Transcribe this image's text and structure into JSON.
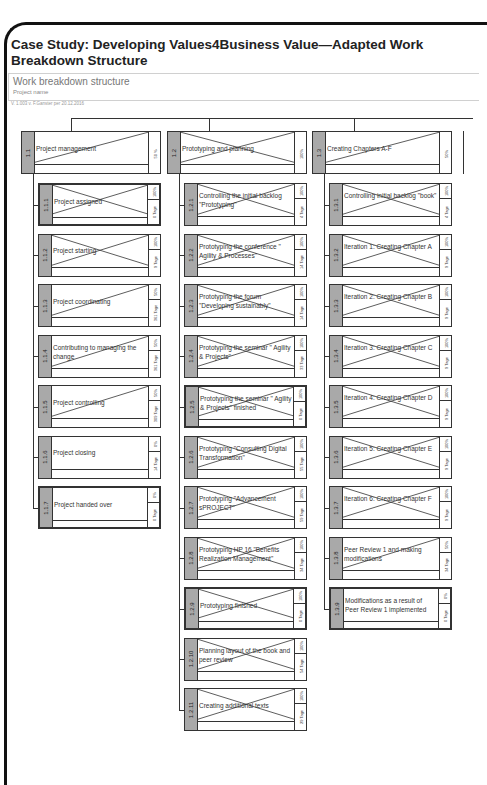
{
  "header": {
    "title": "Case Study: Developing Values4Business Value—Adapted Work Breakdown Structure",
    "wbs_title": "Work breakdown structure",
    "project_name": "Project name",
    "version": "V. 1.003 v. F.Ganster per 20.12.2016"
  },
  "columns": [
    {
      "id": "1.1",
      "label": "Project management",
      "percent": "50 %",
      "cross": "half",
      "children": [
        {
          "id": "1.1.1",
          "label": "Project assigned",
          "percent": "100%",
          "duration": "0 Tage",
          "cross": "full",
          "thick": true
        },
        {
          "id": "1.1.2",
          "label": "Project starting",
          "percent": "100%",
          "duration": "9 Tage",
          "cross": "full",
          "thick": false
        },
        {
          "id": "1.1.3",
          "label": "Project coordinating",
          "percent": "50%",
          "duration": "361 Tage",
          "cross": "half",
          "thick": false
        },
        {
          "id": "1.1.4",
          "label": "Contributing to managing the change",
          "percent": "50%",
          "duration": "361 Tage",
          "cross": "half",
          "thick": false
        },
        {
          "id": "1.1.5",
          "label": "Project controlling",
          "percent": "50%",
          "duration": "309 Tage",
          "cross": "half",
          "thick": false
        },
        {
          "id": "1.1.6",
          "label": "Project closing",
          "percent": "0%",
          "duration": "14 Tage",
          "cross": "none",
          "thick": false
        },
        {
          "id": "1.1.7",
          "label": "Project handed over",
          "percent": "0%",
          "duration": "0 Tage",
          "cross": "none",
          "thick": true
        }
      ]
    },
    {
      "id": "1.2",
      "label": "Prototyping and planning",
      "percent": "100%",
      "cross": "full",
      "children": [
        {
          "id": "1.2.1",
          "label": "Controlling the initial backlog \"Prototyping\"",
          "percent": "100%",
          "duration": "4 Tage",
          "cross": "full",
          "thick": false
        },
        {
          "id": "1.2.2",
          "label": "Prototyping the conference \" Agility & Processes\"",
          "percent": "100%",
          "duration": "14 Tage",
          "cross": "full",
          "thick": false
        },
        {
          "id": "1.2.3",
          "label": "Prototyping the forum \"Developing sustainably\"",
          "percent": "100%",
          "duration": "14 Tage",
          "cross": "full",
          "thick": false
        },
        {
          "id": "1.2.4",
          "label": "Prototyping the seminar \" Agility & Projects\"",
          "percent": "100%",
          "duration": "33 Tage",
          "cross": "full",
          "thick": false
        },
        {
          "id": "1.2.5",
          "label": "Prototyping the seminar \" Agility & Projects\" finished",
          "percent": "100%",
          "duration": "0 Tage",
          "cross": "full",
          "thick": true
        },
        {
          "id": "1.2.6",
          "label": "Prototyping \"Consulting Digital Transformation\"",
          "percent": "100%",
          "duration": "55 Tage",
          "cross": "full",
          "thick": false
        },
        {
          "id": "1.2.7",
          "label": "Prototyping \"Advancement sPROJECT\"",
          "percent": "100%",
          "duration": "59 Tage",
          "cross": "full",
          "thick": false
        },
        {
          "id": "1.2.8",
          "label": "Prototyping HP 16 \"Benefits Realization Management\"",
          "percent": "100%",
          "duration": "34 Tage",
          "cross": "full",
          "thick": false
        },
        {
          "id": "1.2.9",
          "label": "Prototyping finished",
          "percent": "100%",
          "duration": "0 Tage",
          "cross": "full",
          "thick": true
        },
        {
          "id": "1.2.10",
          "label": "Planning layout of the book and peer review",
          "percent": "100%",
          "duration": "54 Tage",
          "cross": "full",
          "thick": false
        },
        {
          "id": "1.2.11",
          "label": "Creating additional texts",
          "percent": "100%",
          "duration": "29 Tage",
          "cross": "full",
          "thick": false
        }
      ]
    },
    {
      "id": "1.3",
      "label": "Creating Chapters A-F",
      "percent": "50%",
      "cross": "half",
      "children": [
        {
          "id": "1.3.1",
          "label": "Controlling initial backlog \"book\"",
          "percent": "100%",
          "duration": "4 Tage",
          "cross": "full",
          "thick": false
        },
        {
          "id": "1.3.2",
          "label": "Iteration 1: Creating Chapter A",
          "percent": "100%",
          "duration": "9 Tage",
          "cross": "full",
          "thick": false
        },
        {
          "id": "1.3.3",
          "label": "Iteration 2: Creating Chapter B",
          "percent": "100%",
          "duration": "9 Tage",
          "cross": "full",
          "thick": false
        },
        {
          "id": "1.3.4",
          "label": "Iteration 3: Creating Chapter C",
          "percent": "100%",
          "duration": "9 Tage",
          "cross": "full",
          "thick": false
        },
        {
          "id": "1.3.5",
          "label": "Iteration 4: Creating Chapter D",
          "percent": "100%",
          "duration": "9 Tage",
          "cross": "full",
          "thick": false
        },
        {
          "id": "1.3.6",
          "label": "Iteration 5: Creating Chapter E",
          "percent": "100%",
          "duration": "9 Tage",
          "cross": "full",
          "thick": false
        },
        {
          "id": "1.3.7",
          "label": "Iteration 6: Creating Chapter F",
          "percent": "100%",
          "duration": "9 Tage",
          "cross": "full",
          "thick": false
        },
        {
          "id": "1.3.8",
          "label": "Peer Review 1 and making modifications",
          "percent": "50%",
          "duration": "34 Tage",
          "cross": "half",
          "thick": false
        },
        {
          "id": "1.3.9",
          "label": "Modifications as a result of Peer Review 1 implemented",
          "percent": "0%",
          "duration": "0 Tage",
          "cross": "none",
          "thick": true
        }
      ]
    }
  ]
}
